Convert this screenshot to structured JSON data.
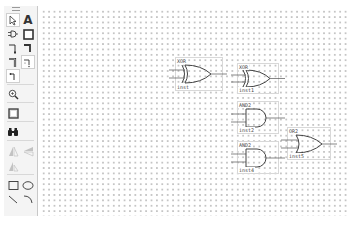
{
  "toolbar": {
    "tools": [
      {
        "name": "selection-tool",
        "icon": "pointer-arrow-icon"
      },
      {
        "name": "text-tool",
        "icon": "text-a-icon",
        "glyph": "A"
      },
      {
        "name": "symbol-tool",
        "icon": "gate-symbol-icon"
      },
      {
        "name": "block-tool",
        "icon": "block-rectangle-icon"
      },
      {
        "name": "orthogonal-node-tool",
        "icon": "node-line-icon"
      },
      {
        "name": "orthogonal-bus-tool",
        "icon": "bus-line-icon"
      },
      {
        "name": "orthogonal-conduit-tool",
        "icon": "conduit-line-icon"
      },
      {
        "name": "rubberbanding-tool",
        "icon": "rubberband-icon"
      },
      {
        "name": "partial-line-tool",
        "icon": "partial-line-icon"
      },
      {
        "name": "zoom-tool",
        "icon": "magnifier-icon"
      },
      {
        "name": "full-screen-tool",
        "icon": "full-screen-icon"
      },
      {
        "name": "find-tool",
        "icon": "binoculars-icon"
      },
      {
        "name": "flip-horizontal-tool",
        "icon": "flip-horizontal-icon"
      },
      {
        "name": "flip-vertical-tool",
        "icon": "flip-vertical-icon"
      },
      {
        "name": "rotate-tool",
        "icon": "rotate-icon"
      },
      {
        "name": "rectangle-tool",
        "icon": "rectangle-icon"
      },
      {
        "name": "oval-tool",
        "icon": "oval-icon"
      },
      {
        "name": "line-tool",
        "icon": "line-icon"
      },
      {
        "name": "arc-tool",
        "icon": "arc-icon"
      }
    ]
  },
  "schematic": {
    "symbols": [
      {
        "type": "XOR",
        "name": "XOR",
        "instance": "inst"
      },
      {
        "type": "XOR",
        "name": "XOR",
        "instance": "inst1"
      },
      {
        "type": "AND2",
        "name": "AND2",
        "instance": "inst2"
      },
      {
        "type": "AND2",
        "name": "AND2",
        "instance": "inst4"
      },
      {
        "type": "OR2",
        "name": "OR2",
        "instance": "inst5"
      }
    ]
  }
}
